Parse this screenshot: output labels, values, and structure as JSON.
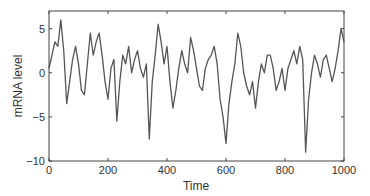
{
  "chart_data": {
    "type": "line",
    "title": "",
    "xlabel": "Time",
    "ylabel": "mRNA level",
    "xlim": [
      0,
      1000
    ],
    "ylim": [
      -10,
      7
    ],
    "xticks": [
      0,
      200,
      400,
      600,
      800,
      1000
    ],
    "xtick_labels": [
      "0",
      "200",
      "400",
      "600",
      "800",
      "1000"
    ],
    "yticks": [
      -10,
      -5,
      0,
      5
    ],
    "ytick_labels": [
      "−10",
      "−5",
      "0",
      "5"
    ],
    "grid": false,
    "legend": null,
    "line_color": "#555555",
    "series": [
      {
        "name": "mRNA level",
        "x": [
          0,
          10,
          20,
          30,
          40,
          50,
          60,
          70,
          80,
          90,
          100,
          110,
          120,
          130,
          140,
          150,
          160,
          170,
          180,
          190,
          200,
          210,
          220,
          230,
          240,
          250,
          260,
          270,
          280,
          290,
          300,
          310,
          320,
          330,
          340,
          350,
          360,
          370,
          380,
          390,
          400,
          410,
          420,
          430,
          440,
          450,
          460,
          470,
          480,
          490,
          500,
          510,
          520,
          530,
          540,
          550,
          560,
          570,
          580,
          590,
          600,
          610,
          620,
          630,
          640,
          650,
          660,
          670,
          680,
          690,
          700,
          710,
          720,
          730,
          740,
          750,
          760,
          770,
          780,
          790,
          800,
          810,
          820,
          830,
          840,
          850,
          860,
          870,
          880,
          890,
          900,
          910,
          920,
          930,
          940,
          950,
          960,
          970,
          980,
          990,
          1000
        ],
        "values": [
          0.5,
          2.0,
          3.5,
          3.0,
          6.0,
          2.5,
          -3.5,
          -1.0,
          1.5,
          3.0,
          1.0,
          -2.0,
          -2.5,
          1.0,
          4.5,
          2.0,
          3.5,
          4.5,
          2.0,
          -1.0,
          -3.0,
          0.5,
          1.5,
          -5.5,
          -1.0,
          2.0,
          1.0,
          3.0,
          0.0,
          1.5,
          2.5,
          0.5,
          -0.5,
          1.0,
          -7.5,
          -1.0,
          2.0,
          5.5,
          3.5,
          1.0,
          3.0,
          -1.0,
          -4.0,
          -2.0,
          0.5,
          2.5,
          1.0,
          0.0,
          4.0,
          2.5,
          0.5,
          -1.5,
          -2.0,
          0.5,
          1.5,
          2.0,
          3.0,
          1.0,
          -3.0,
          -5.0,
          -8.0,
          -3.5,
          -1.0,
          1.0,
          4.5,
          3.0,
          0.0,
          -1.5,
          -2.5,
          -1.0,
          -4.0,
          -1.0,
          1.0,
          0.0,
          2.0,
          2.0,
          0.5,
          -2.0,
          -1.0,
          0.5,
          -2.0,
          0.5,
          1.5,
          2.5,
          1.0,
          3.0,
          1.5,
          -9.0,
          -3.0,
          0.0,
          2.0,
          1.0,
          -0.5,
          1.5,
          2.0,
          0.5,
          -1.0,
          0.5,
          2.5,
          5.0,
          3.5
        ]
      }
    ]
  }
}
